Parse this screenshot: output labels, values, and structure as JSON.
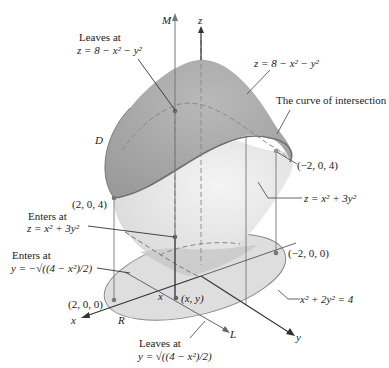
{
  "diagram": {
    "type": "3d-region-between-surfaces",
    "axes": {
      "z_label": "z",
      "x_label": "x",
      "y_label": "y",
      "line_M_label": "M",
      "line_L_label": "L"
    },
    "surfaces": {
      "upper": "z = 8 − x² − y²",
      "lower": "z = x² + 3y²"
    },
    "labels": {
      "leaves_top_title": "Leaves at",
      "leaves_top_eq": "z = 8 − x² − y²",
      "upper_surface_eq": "z = 8 − x² − y²",
      "curve_of_intersection": "The curve of intersection",
      "D": "D",
      "point_neg2_0_4": "(−2, 0, 4)",
      "point_2_0_4": "(2, 0, 4)",
      "lower_surface_eq": "z = x² + 3y²",
      "enters_z_title": "Enters at",
      "enters_z_eq": "z = x² + 3y²",
      "enters_y_title": "Enters at",
      "enters_y_eq": "y = −√((4 − x²)/2)",
      "point_neg2_0_0": "(−2, 0, 0)",
      "ellipse_eq": "x² + 2y² = 4",
      "point_2_0_0": "(2, 0, 0)",
      "x_tick": "x",
      "point_xy": "(x, y)",
      "R": "R",
      "leaves_y_title": "Leaves at",
      "leaves_y_eq": "y = √((4 − x²)/2)"
    },
    "colors": {
      "upper_surface": "#a9a9a9",
      "lower_surface": "#e4e4e4",
      "ellipse_fill": "#dcdcdc",
      "curve": "#707070",
      "axis": "#333333"
    }
  }
}
